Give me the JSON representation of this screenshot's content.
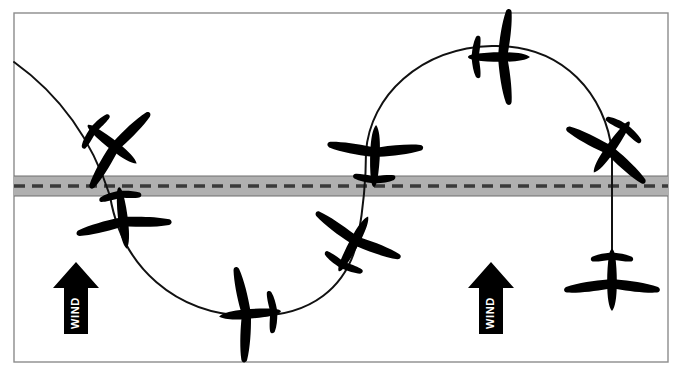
{
  "diagram": {
    "canvas": {
      "width": 685,
      "height": 377
    },
    "background_color": "#ffffff",
    "frame": {
      "name": "diagram-border",
      "x": 14,
      "y": 13,
      "width": 654,
      "height": 349,
      "stroke_color": "#8c8c8c",
      "stroke_width": 1.4,
      "fill": "none"
    },
    "runway": {
      "name": "runway-strip",
      "x": 14,
      "y": 176,
      "width": 654,
      "height": 20,
      "fill_color": "#b0b0b0",
      "edge_color": "#6e6e6e",
      "edge_width": 1.2,
      "centerline": {
        "y": 186,
        "color": "#3a3a3a",
        "width": 3.4,
        "dash": "11 7"
      }
    },
    "flight_path": {
      "name": "flight-path",
      "stroke_color": "#111111",
      "stroke_width": 2.0,
      "fill": "none",
      "description": "S-shaped pattern: descending arc at left, U-turn below runway, climbing arch above runway, vertical descent at right",
      "segments": [
        {
          "name": "left-descending-arc",
          "d": "M 14,62 C 60,95 92,140 110,196"
        },
        {
          "name": "lower-u-turn",
          "d": "M 110,196 C 122,268 176,314 248,316 C 312,318 348,286 358,238"
        },
        {
          "name": "climb-to-runway",
          "d": "M 358,238 C 364,204 366,180 366,152"
        },
        {
          "name": "upper-arch",
          "d": "M 366,152 C 370,96 420,48 492,46 C 564,44 606,96 612,152"
        },
        {
          "name": "right-vertical-descent",
          "d": "M 612,152 L 612,290"
        }
      ]
    },
    "wind_arrows": [
      {
        "name": "wind-arrow-left",
        "label": "WIND",
        "cx": 76,
        "top_y": 262,
        "bottom_y": 334,
        "shaft_width": 24,
        "head_width": 46,
        "head_height": 26,
        "fill_color": "#000000",
        "label_color": "#ffffff",
        "direction": "up"
      },
      {
        "name": "wind-arrow-right",
        "label": "WIND",
        "cx": 491,
        "top_y": 262,
        "bottom_y": 334,
        "shaft_width": 24,
        "head_width": 46,
        "head_height": 26,
        "fill_color": "#000000",
        "label_color": "#ffffff",
        "direction": "up"
      }
    ],
    "aircraft_color": "#000000",
    "aircraft": [
      {
        "name": "aircraft-left-upper",
        "position_label": "Left descending, above runway",
        "cx": 113,
        "cy": 145,
        "rotation": 128,
        "scale": 1.0,
        "heading": "descending right"
      },
      {
        "name": "aircraft-left-lower",
        "position_label": "Left, just below runway",
        "cx": 123,
        "cy": 219,
        "rotation": 173,
        "scale": 1.0,
        "heading": "descending"
      },
      {
        "name": "aircraft-bottom-center",
        "position_label": "Bottom of U-turn",
        "cx": 249,
        "cy": 314,
        "rotation": 265,
        "scale": 1.0,
        "heading": "level turn, wings vertical"
      },
      {
        "name": "aircraft-center-climb",
        "position_label": "Climbing toward runway",
        "cx": 354,
        "cy": 243,
        "rotation": 28,
        "scale": 1.0,
        "heading": "climbing right"
      },
      {
        "name": "aircraft-center-runway",
        "position_label": "Crossing runway, center",
        "cx": 375,
        "cy": 155,
        "rotation": 2,
        "scale": 1.0,
        "heading": "climbing"
      },
      {
        "name": "aircraft-top-center",
        "position_label": "Top of arch",
        "cx": 500,
        "cy": 57,
        "rotation": 90,
        "scale": 1.0,
        "heading": "level, wings vertical"
      },
      {
        "name": "aircraft-right-upper",
        "position_label": "Right descending, above runway",
        "cx": 611,
        "cy": 148,
        "rotation": 215,
        "scale": 1.0,
        "heading": "descending left"
      },
      {
        "name": "aircraft-right-lower",
        "position_label": "Right, below runway",
        "cx": 612,
        "cy": 281,
        "rotation": 180,
        "scale": 1.0,
        "heading": "descending"
      }
    ]
  }
}
